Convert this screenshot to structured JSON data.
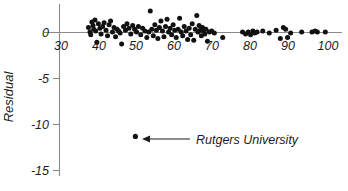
{
  "chart_data": {
    "type": "scatter",
    "title": "",
    "subtitle": "",
    "xlabel": "",
    "ylabel": "Residual",
    "xlim": [
      30,
      100
    ],
    "ylim": [
      -15,
      3
    ],
    "grid": false,
    "legend": null,
    "x_ticks": [
      30,
      40,
      50,
      60,
      70,
      80,
      90,
      100
    ],
    "x_tick_labels": [
      "30",
      "40",
      "50",
      "60",
      "70",
      "80",
      "90",
      "100"
    ],
    "y_ticks": [
      0,
      -5,
      -10,
      -15
    ],
    "y_tick_labels": [
      "0",
      "-5",
      "-10",
      "-15"
    ],
    "reference_line": {
      "y": 0,
      "label": ""
    },
    "marker_color": "#111111",
    "axis_color": "#8a8a8a",
    "points": [
      [
        37.2,
        0.55
      ],
      [
        37.6,
        0.05
      ],
      [
        37.8,
        -0.25
      ],
      [
        38.1,
        1.15
      ],
      [
        38.4,
        0.75
      ],
      [
        38.6,
        0.35
      ],
      [
        38.9,
        1.35
      ],
      [
        39.1,
        0.15
      ],
      [
        39.4,
        -1.05
      ],
      [
        39.8,
        0.95
      ],
      [
        40.2,
        0.45
      ],
      [
        40.5,
        -0.15
      ],
      [
        40.9,
        0.65
      ],
      [
        41.3,
        1.05
      ],
      [
        41.8,
        0.25
      ],
      [
        42.2,
        -0.35
      ],
      [
        42.6,
        0.85
      ],
      [
        43.0,
        1.25
      ],
      [
        43.5,
        0.05
      ],
      [
        43.9,
        0.55
      ],
      [
        44.3,
        -0.45
      ],
      [
        44.7,
        0.35
      ],
      [
        45.1,
        0.15
      ],
      [
        45.5,
        -0.05
      ],
      [
        45.9,
        -1.25
      ],
      [
        46.4,
        0.65
      ],
      [
        46.9,
        0.25
      ],
      [
        47.3,
        0.95
      ],
      [
        47.8,
        0.45
      ],
      [
        48.3,
        -0.15
      ],
      [
        48.8,
        0.75
      ],
      [
        49.3,
        0.35
      ],
      [
        49.8,
        0.05
      ],
      [
        50.3,
        0.65
      ],
      [
        50.9,
        -0.25
      ],
      [
        51.4,
        0.45
      ],
      [
        52.0,
        0.15
      ],
      [
        52.5,
        -0.55
      ],
      [
        53.0,
        0.05
      ],
      [
        53.4,
        2.35
      ],
      [
        53.8,
        0.35
      ],
      [
        54.2,
        -0.35
      ],
      [
        54.6,
        0.85
      ],
      [
        55.0,
        0.25
      ],
      [
        55.4,
        -0.65
      ],
      [
        55.8,
        0.55
      ],
      [
        56.2,
        1.25
      ],
      [
        56.6,
        0.15
      ],
      [
        57.0,
        -0.45
      ],
      [
        57.4,
        0.65
      ],
      [
        57.8,
        1.45
      ],
      [
        58.2,
        0.05
      ],
      [
        58.6,
        0.45
      ],
      [
        59.0,
        -0.25
      ],
      [
        59.4,
        0.85
      ],
      [
        59.8,
        0.25
      ],
      [
        60.2,
        -0.55
      ],
      [
        60.7,
        0.35
      ],
      [
        61.1,
        1.55
      ],
      [
        61.5,
        0.05
      ],
      [
        61.9,
        -0.35
      ],
      [
        62.3,
        0.65
      ],
      [
        62.8,
        0.15
      ],
      [
        63.2,
        -0.75
      ],
      [
        63.6,
        0.45
      ],
      [
        64.0,
        -0.25
      ],
      [
        64.4,
        0.95
      ],
      [
        64.8,
        -0.85
      ],
      [
        65.2,
        0.35
      ],
      [
        65.6,
        1.85
      ],
      [
        65.9,
        0.05
      ],
      [
        66.2,
        0.75
      ],
      [
        66.5,
        0.25
      ],
      [
        66.8,
        -0.35
      ],
      [
        67.1,
        0.55
      ],
      [
        67.4,
        0.15
      ],
      [
        67.7,
        -0.15
      ],
      [
        68.0,
        0.35
      ],
      [
        68.4,
        -0.95
      ],
      [
        68.9,
        0.05
      ],
      [
        69.5,
        0.15
      ],
      [
        70.2,
        -0.05
      ],
      [
        72.4,
        -0.55
      ],
      [
        77.6,
        0.05
      ],
      [
        78.4,
        -0.15
      ],
      [
        79.1,
        0.05
      ],
      [
        79.7,
        -0.25
      ],
      [
        80.3,
        0.15
      ],
      [
        80.8,
        -0.05
      ],
      [
        81.4,
        0.05
      ],
      [
        82.9,
        0.15
      ],
      [
        84.6,
        -0.05
      ],
      [
        86.4,
        0.25
      ],
      [
        87.5,
        -0.65
      ],
      [
        88.3,
        0.55
      ],
      [
        88.9,
        0.35
      ],
      [
        89.4,
        -0.55
      ],
      [
        90.2,
        -0.05
      ],
      [
        93.1,
        0.05
      ],
      [
        95.8,
        0.05
      ],
      [
        96.6,
        0.15
      ],
      [
        97.2,
        0.05
      ],
      [
        99.3,
        0.05
      ]
    ],
    "annotations": [
      {
        "label": "Rutgers University",
        "point": [
          49.5,
          -11.3
        ],
        "arrow": true
      }
    ]
  }
}
